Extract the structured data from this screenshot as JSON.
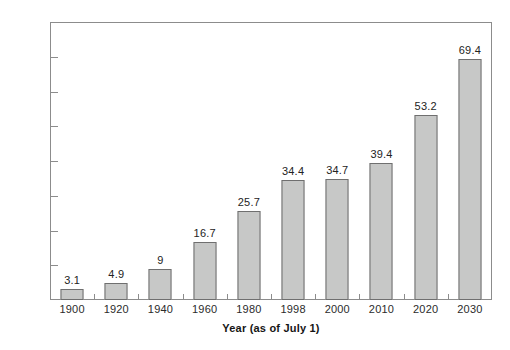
{
  "chart_data": {
    "type": "bar",
    "title": "",
    "subtitle": "",
    "xlabel": "Year (as of July 1)",
    "ylabel": "",
    "categories": [
      "1900",
      "1920",
      "1940",
      "1960",
      "1980",
      "1998",
      "2000",
      "2010",
      "2020",
      "2030"
    ],
    "values": [
      3.1,
      4.9,
      9,
      16.7,
      25.7,
      34.4,
      34.7,
      39.4,
      53.2,
      69.4
    ],
    "value_labels": [
      "3.1",
      "4.9",
      "9",
      "16.7",
      "25.7",
      "34.4",
      "34.7",
      "39.4",
      "53.2",
      "69.4"
    ],
    "ylim": [
      0,
      80
    ],
    "ytick_step": 10,
    "ytick_labels": [
      "0",
      "10",
      "20",
      "30",
      "40",
      "50",
      "60",
      "70",
      "80"
    ],
    "grid": false,
    "legend": null,
    "legend_position": "none",
    "bar_fill_color": "#c7c8c7",
    "bar_border_color": "#6f6f6f",
    "axis_color": "#8c8c8c",
    "text_color": "#2b2b2b",
    "background_color": "#ffffff"
  }
}
